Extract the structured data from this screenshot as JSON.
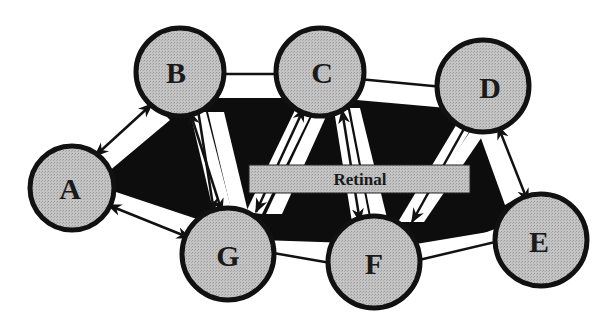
{
  "diagram": {
    "type": "network",
    "colors": {
      "node_fill": "#bdbdbd",
      "node_stroke": "#111111",
      "background_region": "#0d0d0d",
      "channel": "#ffffff",
      "arrow": "#111111",
      "bar_fill": "#bdbdbd"
    },
    "nodes": [
      {
        "id": "A",
        "label": "A",
        "cx": 72,
        "cy": 188
      },
      {
        "id": "B",
        "label": "B",
        "cx": 180,
        "cy": 72
      },
      {
        "id": "C",
        "label": "C",
        "cx": 320,
        "cy": 72
      },
      {
        "id": "D",
        "label": "D",
        "cx": 483,
        "cy": 86
      },
      {
        "id": "E",
        "label": "E",
        "cx": 541,
        "cy": 240
      },
      {
        "id": "F",
        "label": "F",
        "cx": 374,
        "cy": 262
      },
      {
        "id": "G",
        "label": "G",
        "cx": 228,
        "cy": 254
      }
    ],
    "central_bar": {
      "label": "Retinal"
    },
    "edges": [
      {
        "from": "A",
        "to": "B",
        "direction": "bidirectional"
      },
      {
        "from": "B",
        "to": "C",
        "direction": "bidirectional"
      },
      {
        "from": "C",
        "to": "D",
        "direction": "bidirectional"
      },
      {
        "from": "D",
        "to": "E",
        "direction": "bidirectional"
      },
      {
        "from": "A",
        "to": "G",
        "direction": "bidirectional"
      },
      {
        "from": "G",
        "to": "F",
        "direction": "bidirectional"
      },
      {
        "from": "F",
        "to": "E",
        "direction": "bidirectional"
      },
      {
        "from": "B",
        "to": "G",
        "direction": "bidirectional"
      },
      {
        "from": "C",
        "to": "G",
        "direction": "bidirectional"
      },
      {
        "from": "C",
        "to": "F",
        "direction": "bidirectional"
      },
      {
        "from": "D",
        "to": "F",
        "direction": "bidirectional"
      }
    ]
  }
}
